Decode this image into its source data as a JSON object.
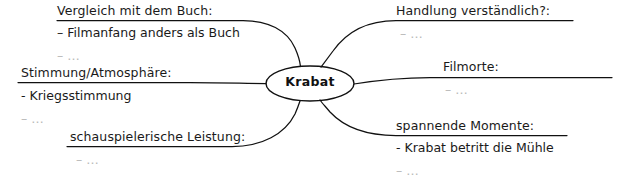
{
  "diagram": {
    "type": "mind-map",
    "center": {
      "label": "Krabat"
    },
    "branches": [
      {
        "id": "vergleich",
        "heading": "Vergleich mit dem Buch:",
        "position": "top-left",
        "items": [
          {
            "text": "– Filmanfang anders als Buch",
            "faint": false
          },
          {
            "text": "– …",
            "faint": true
          }
        ]
      },
      {
        "id": "stimmung",
        "heading": "Stimmung/Atmosphäre:",
        "position": "left",
        "items": [
          {
            "text": "- Kriegsstimmung",
            "faint": false
          },
          {
            "text": "– …",
            "faint": true
          }
        ]
      },
      {
        "id": "schauspielerische",
        "heading": "schauspielerische Leistung:",
        "position": "bottom-left",
        "items": [
          {
            "text": "– …",
            "faint": true
          }
        ]
      },
      {
        "id": "handlung",
        "heading": "Handlung verständlich?:",
        "position": "top-right",
        "items": [
          {
            "text": "– …",
            "faint": true
          }
        ]
      },
      {
        "id": "filmorte",
        "heading": "Filmorte:",
        "position": "right",
        "items": [
          {
            "text": "– …",
            "faint": true
          }
        ]
      },
      {
        "id": "spannende",
        "heading": "spannende Momente:",
        "position": "bottom-right",
        "items": [
          {
            "text": "- Krabat betritt die Mühle",
            "faint": false
          },
          {
            "text": "– …",
            "faint": true
          }
        ]
      }
    ]
  },
  "colors": {
    "background": "#ffffff",
    "ink": "#1a1a1a",
    "faint_ink": "#b9b9b9",
    "stroke": "#111111"
  }
}
